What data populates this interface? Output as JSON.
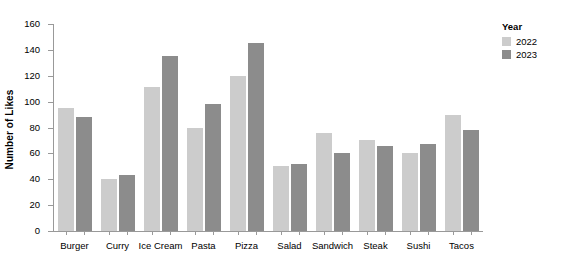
{
  "chart_data": {
    "type": "bar",
    "title": "",
    "xlabel": "",
    "ylabel": "Number of Likes",
    "ylim": [
      0,
      160
    ],
    "yticks": [
      0,
      20,
      40,
      60,
      80,
      100,
      120,
      140,
      160
    ],
    "grid": false,
    "legend_position": "right",
    "legend_title": "Year",
    "categories": [
      "Burger",
      "Curry",
      "Ice Cream",
      "Pasta",
      "Pizza",
      "Salad",
      "Sandwich",
      "Steak",
      "Sushi",
      "Tacos"
    ],
    "series": [
      {
        "name": "2022",
        "color": "#cccccc",
        "values": [
          95,
          40,
          111,
          80,
          120,
          50,
          76,
          70,
          60,
          90
        ]
      },
      {
        "name": "2023",
        "color": "#8c8c8c",
        "values": [
          88,
          43,
          135,
          98,
          145,
          52,
          60,
          66,
          67,
          78
        ]
      }
    ]
  },
  "axis": {
    "y_title": "Number of Likes"
  },
  "legend": {
    "title": "Year"
  }
}
